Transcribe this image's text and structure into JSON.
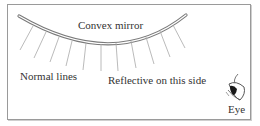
{
  "diagram": {
    "type": "optics-illustration",
    "labels": {
      "mirror": "Convex mirror",
      "normals": "Normal lines",
      "reflective_side": "Reflective on this side",
      "eye": "Eye"
    },
    "elements": {
      "mirror_shape": "convex curve (double line)",
      "normal_line_count": 11,
      "observer": "eye viewing from lower right"
    },
    "colors": {
      "line": "#8a8a8a",
      "text": "#333333",
      "border": "#9a9a9a"
    }
  }
}
